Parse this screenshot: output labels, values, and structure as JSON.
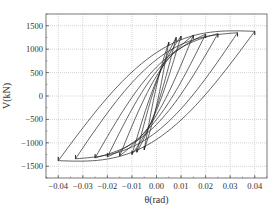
{
  "chart_data": {
    "type": "line",
    "title": "",
    "xlabel": "θ(rad)",
    "ylabel": "V(kN)",
    "xlim": [
      -0.045,
      0.045
    ],
    "ylim": [
      -1750,
      1750
    ],
    "xticks": [
      -0.04,
      -0.03,
      -0.02,
      -0.01,
      0.0,
      0.01,
      0.02,
      0.03,
      0.04
    ],
    "xtick_labels": [
      "−0.04",
      "−0.03",
      "−0.02",
      "−0.01",
      "0.00",
      "0.01",
      "0.02",
      "0.03",
      "0.04"
    ],
    "yticks": [
      -1500,
      -1000,
      -500,
      0,
      500,
      1000,
      1500
    ],
    "ytick_labels": [
      "−1500",
      "−1000",
      "−500",
      "0",
      "500",
      "1000",
      "1500"
    ],
    "grid": true,
    "legend": null,
    "series": [
      {
        "name": "cycle-1",
        "amplitude": 0.005,
        "peak_pos": 1150,
        "peak_neg": -1150
      },
      {
        "name": "cycle-2",
        "amplitude": 0.008,
        "peak_pos": 1250,
        "peak_neg": -1200
      },
      {
        "name": "cycle-3",
        "amplitude": 0.01,
        "peak_pos": 1280,
        "peak_neg": -1250
      },
      {
        "name": "cycle-4",
        "amplitude": 0.015,
        "peak_pos": 1300,
        "peak_neg": -1280
      },
      {
        "name": "cycle-5",
        "amplitude": 0.02,
        "peak_pos": 1320,
        "peak_neg": -1300
      },
      {
        "name": "cycle-6",
        "amplitude": 0.025,
        "peak_pos": 1330,
        "peak_neg": -1320
      },
      {
        "name": "cycle-7",
        "amplitude": 0.033,
        "peak_pos": 1350,
        "peak_neg": -1340
      },
      {
        "name": "cycle-8",
        "amplitude": 0.04,
        "peak_pos": 1380,
        "peak_neg": -1380
      }
    ]
  }
}
